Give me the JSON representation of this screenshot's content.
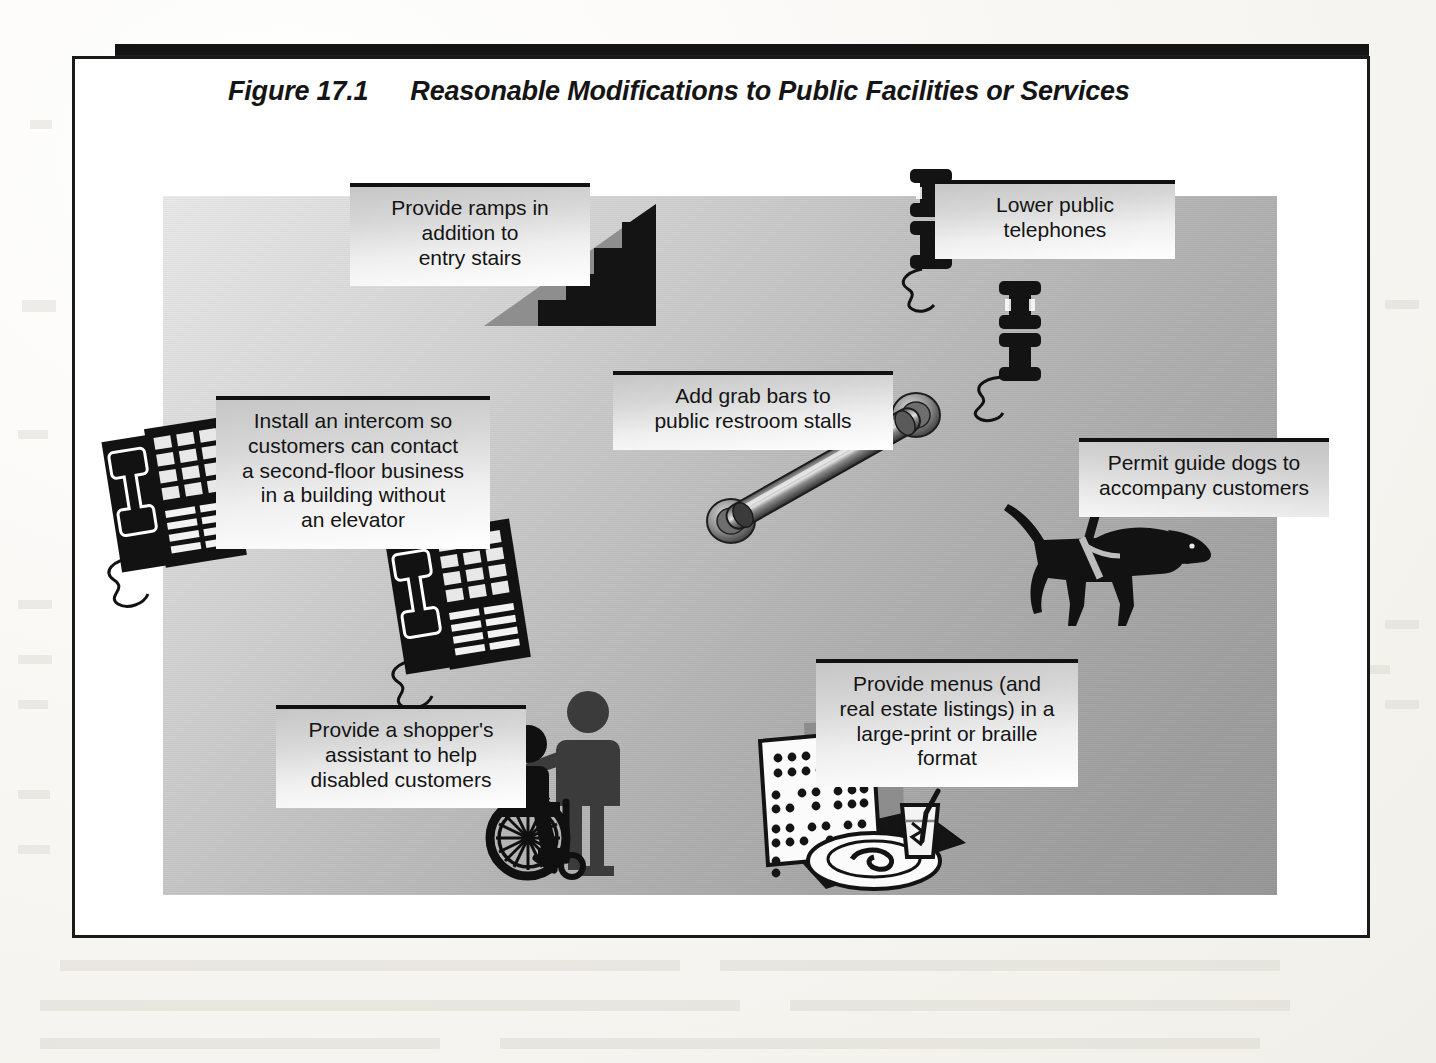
{
  "figure": {
    "number": "Figure 17.1",
    "title": "Reasonable Modifications to Public Facilities or Services"
  },
  "callouts": [
    {
      "id": "ramps",
      "icon": "ramp-stairs-icon",
      "lines": [
        "Provide ramps in",
        "addition to",
        "entry stairs"
      ]
    },
    {
      "id": "telephones",
      "icon": "wall-telephone-icon",
      "lines": [
        "Lower public",
        "telephones"
      ]
    },
    {
      "id": "intercom",
      "icon": "intercom-phone-icon",
      "lines": [
        "Install an intercom so",
        "customers can contact",
        "a second-floor business",
        "in a building without",
        "an elevator"
      ]
    },
    {
      "id": "grabbars",
      "icon": "grab-bar-icon",
      "lines": [
        "Add grab bars to",
        "public restroom stalls"
      ]
    },
    {
      "id": "guidedogs",
      "icon": "guide-dog-icon",
      "lines": [
        "Permit guide dogs to",
        "accompany customers"
      ]
    },
    {
      "id": "shopper",
      "icon": "wheelchair-attendant-icon",
      "lines": [
        "Provide a shopper's",
        "assistant to help",
        "disabled customers"
      ]
    },
    {
      "id": "braille",
      "icon": "braille-menu-icon",
      "lines": [
        "Provide menus (and",
        "real estate listings) in a",
        "large-print or braille",
        "format"
      ]
    }
  ],
  "colors": {
    "rule": "#141414",
    "frame": "#1a1a1a",
    "callout_top_rule": "#111111",
    "artboard_light": "#e9e9e9",
    "artboard_dark": "#979797",
    "ink": "#141414"
  }
}
